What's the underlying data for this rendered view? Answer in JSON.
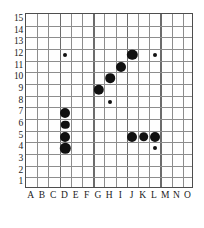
{
  "chart_data": {
    "type": "scatter",
    "title": "",
    "subtitle": "",
    "xlabel": "",
    "ylabel": "",
    "caption": "",
    "grid": true,
    "legend": null,
    "legend_position": "none",
    "x_categories": [
      "A",
      "B",
      "C",
      "D",
      "E",
      "F",
      "G",
      "H",
      "I",
      "J",
      "K",
      "L",
      "M",
      "N",
      "O"
    ],
    "y_ticks": [
      15,
      14,
      13,
      12,
      11,
      10,
      9,
      8,
      7,
      6,
      5,
      4,
      3,
      2,
      1
    ],
    "xlim": [
      "A",
      "O"
    ],
    "ylim": [
      1,
      15
    ],
    "point_color": "#111111",
    "grid_color": "#8c8c8c",
    "grid_major_color": "#6b6b6b",
    "border_color": "#4d4d4d",
    "points": [
      {
        "label": "D12",
        "x": "D",
        "y": 12,
        "size": "small",
        "r": 2.0
      },
      {
        "label": "G9",
        "x": "G",
        "y": 9,
        "size": "large",
        "r": 5.2
      },
      {
        "label": "H10",
        "x": "H",
        "y": 10,
        "size": "large",
        "r": 4.8
      },
      {
        "label": "I11",
        "x": "I",
        "y": 11,
        "size": "large",
        "r": 5.0
      },
      {
        "label": "J12",
        "x": "J",
        "y": 12,
        "size": "large",
        "r": 5.2
      },
      {
        "label": "L12",
        "x": "L",
        "y": 12,
        "size": "small",
        "r": 2.0
      },
      {
        "label": "H8",
        "x": "H",
        "y": 8,
        "size": "small",
        "r": 2.0
      },
      {
        "label": "D7",
        "x": "D",
        "y": 7,
        "size": "large",
        "r": 5.0
      },
      {
        "label": "D6",
        "x": "D",
        "y": 6,
        "size": "medium",
        "r": 4.2
      },
      {
        "label": "D5",
        "x": "D",
        "y": 5,
        "size": "large",
        "r": 5.0
      },
      {
        "label": "D4",
        "x": "D",
        "y": 4,
        "size": "large",
        "r": 5.2
      },
      {
        "label": "J5",
        "x": "J",
        "y": 5,
        "size": "large",
        "r": 5.0
      },
      {
        "label": "K5",
        "x": "K",
        "y": 5,
        "size": "large",
        "r": 4.8
      },
      {
        "label": "L5",
        "x": "L",
        "y": 5,
        "size": "large",
        "r": 5.0
      },
      {
        "label": "L4",
        "x": "L",
        "y": 4,
        "size": "small",
        "r": 2.0
      }
    ]
  }
}
